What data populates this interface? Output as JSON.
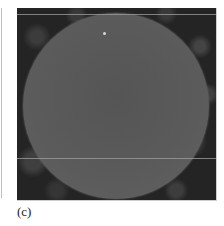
{
  "figure": {
    "panel_label": "(c)",
    "image_description": "grayscale micrograph of a circular particle with two horizontal lines",
    "colors": {
      "particle": "#5a5a5a",
      "background": "#262626",
      "lines": "#9a9a9a"
    }
  }
}
